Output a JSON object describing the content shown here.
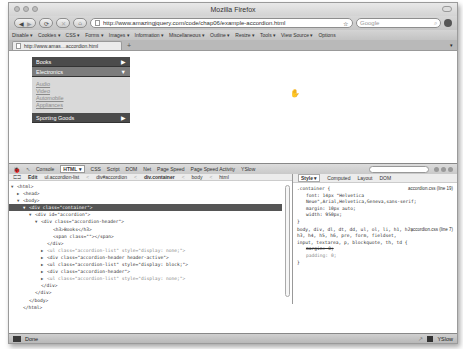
{
  "window": {
    "title": "Mozilla Firefox"
  },
  "navbar": {
    "back_icon": "◀",
    "forward_icon": "▶",
    "reload_icon": "⟳",
    "stop_icon": "✕",
    "home_icon": "⌂",
    "url": "http://www.amazingjquery.com/code/chap06/example-accordion.html",
    "bookmark_icon": "☆",
    "search_placeholder": "Google",
    "search_icon": "⌕"
  },
  "devbar": {
    "items": [
      "Disable ▾",
      "Cookies ▾",
      "CSS ▾",
      "Forms ▾",
      "Images ▾",
      "Information ▾",
      "Miscellaneous ▾",
      "Outline ▾",
      "Resize ▾",
      "Tools ▾",
      "View Source ▾",
      "Options"
    ]
  },
  "tabs": {
    "active_label": "http://www.amas…accordion.html",
    "new_tab_label": "+",
    "list_icon": "▾"
  },
  "accordion": {
    "sections": [
      {
        "label": "Books",
        "arrow": "▶"
      },
      {
        "label": "Electronics",
        "arrow": "▼"
      },
      {
        "label": "Sporting Goods",
        "arrow": "▶"
      }
    ],
    "electronics_items": [
      "Audio",
      "Video",
      "Automobile",
      "Appliances"
    ]
  },
  "firebug": {
    "tabs": [
      "Console",
      "HTML ▾",
      "CSS",
      "Script",
      "DOM",
      "Net",
      "Page Speed",
      "Page Speed Activity",
      "YSlow"
    ],
    "breadcrumb": {
      "edit": "Edit",
      "items": [
        "ul.accordion-list",
        "div#accordion",
        "div.container",
        "body",
        "html"
      ]
    },
    "tree": [
      {
        "text": "<html>",
        "indent": 0,
        "twisty": "▼"
      },
      {
        "text": "<head>",
        "indent": 1,
        "twisty": "▶"
      },
      {
        "text": "<body>",
        "indent": 1,
        "twisty": "▼"
      },
      {
        "text": "<div class=\"container\">",
        "indent": 2,
        "twisty": "▼",
        "selected": true
      },
      {
        "text": "<div id=\"accordion\">",
        "indent": 3,
        "twisty": "▼"
      },
      {
        "text": "<div class=\"accordion-header\">",
        "indent": 4,
        "twisty": "▼"
      },
      {
        "text": "<h3>Books</h3>",
        "indent": 6,
        "twisty": ""
      },
      {
        "text": "<span class=\"\"></span>",
        "indent": 6,
        "twisty": ""
      },
      {
        "text": "</div>",
        "indent": 5,
        "twisty": ""
      },
      {
        "text": "<ul class=\"accordion-list\" style=\"display: none;\">",
        "indent": 5,
        "twisty": "▶",
        "dim": true
      },
      {
        "text": "<div class=\"accordion-header header-active\">",
        "indent": 5,
        "twisty": "▶"
      },
      {
        "text": "<ul class=\"accordion-list\" style=\"display: block;\">",
        "indent": 5,
        "twisty": "▶"
      },
      {
        "text": "<div class=\"accordion-header\">",
        "indent": 5,
        "twisty": "▶"
      },
      {
        "text": "<ul class=\"accordion-list\" style=\"display: none;\">",
        "indent": 5,
        "twisty": "▶",
        "dim": true
      },
      {
        "text": "</div>",
        "indent": 4,
        "twisty": ""
      },
      {
        "text": "</div>",
        "indent": 3,
        "twisty": ""
      },
      {
        "text": "</body>",
        "indent": 2,
        "twisty": ""
      },
      {
        "text": "</html>",
        "indent": 1,
        "twisty": ""
      }
    ],
    "style_tabs": [
      "Style ▾",
      "Computed",
      "Layout",
      "DOM"
    ],
    "rules": [
      {
        "selector": ".container {",
        "source": "accordion.css (line 19)",
        "props": [
          "font: 14px \"Helvetica",
          "Neue\",Arial,Helvetica,Geneva,sans-serif;",
          "margin: 10px auto;",
          "width: 950px;"
        ],
        "struck": []
      },
      {
        "selector": "body, div, dl, dt, dd, ul, ol, li, h1, h2, h3, h4, h5, h6, pre, form, fieldset, input, textarea, p, blockquote, th, td {",
        "source": "accordion.css (line 7)",
        "props": [
          "margin: 0;",
          "padding: 0;"
        ],
        "struck": [
          "margin: 0;"
        ]
      }
    ]
  },
  "status": {
    "text": "Done",
    "yslow_label": "YSlow"
  }
}
